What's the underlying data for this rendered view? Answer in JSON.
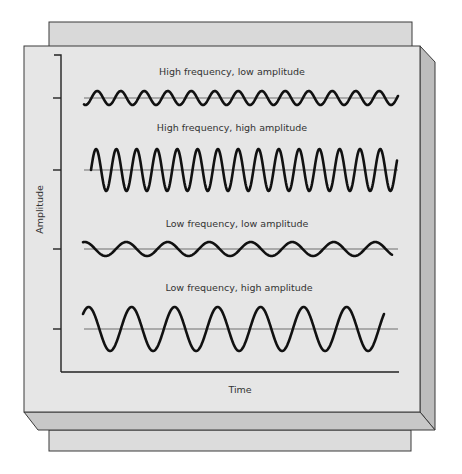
{
  "figure": {
    "x_axis_label": "Time",
    "y_axis_label": "Amplitude",
    "colors": {
      "panel_face": "#e6e6e6",
      "panel_back": "#d9d9d9",
      "bevel_right": "#bdbdbd",
      "bevel_bottom": "#c8c8c8",
      "outline": "#3a3a3a",
      "axis": "#222222",
      "baseline": "#6e6e6e",
      "wave": "#111111",
      "text": "#333333"
    },
    "waves": [
      {
        "label": "High frequency, low amplitude",
        "frequency": "high",
        "amplitude": "low",
        "baseline_y": 98,
        "amp_px": 7,
        "period_px": 23.5,
        "x_start": 84,
        "x_end": 398,
        "phase": 4.3
      },
      {
        "label": "High frequency, high amplitude",
        "frequency": "high",
        "amplitude": "high",
        "baseline_y": 170,
        "amp_px": 21,
        "period_px": 20.3,
        "x_start": 91,
        "x_end": 397,
        "phase": 0.0
      },
      {
        "label": "Low frequency, low amplitude",
        "frequency": "low",
        "amplitude": "low",
        "baseline_y": 249,
        "amp_px": 7,
        "period_px": 41.5,
        "x_start": 83,
        "x_end": 392,
        "phase": 1.3
      },
      {
        "label": "Low frequency, high amplitude",
        "frequency": "low",
        "amplitude": "high",
        "baseline_y": 329,
        "amp_px": 22,
        "period_px": 43,
        "x_start": 83,
        "x_end": 384,
        "phase": 0.75
      }
    ]
  }
}
